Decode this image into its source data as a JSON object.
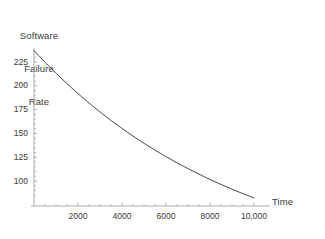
{
  "chart_data": {
    "type": "line",
    "title": "",
    "ylabel_lines": [
      "Software",
      "Failure",
      "Rate"
    ],
    "ylabel": "Software Failure Rate",
    "xlabel": "Time",
    "xlim": [
      0,
      10500
    ],
    "ylim": [
      78,
      245
    ],
    "grid": false,
    "legend": null,
    "x_ticks": [
      {
        "value": 2000,
        "label": "2000"
      },
      {
        "value": 4000,
        "label": "4000"
      },
      {
        "value": 6000,
        "label": "6000"
      },
      {
        "value": 8000,
        "label": "8000"
      },
      {
        "value": 10000,
        "label": "10,000"
      }
    ],
    "x_minor_tick_interval": 500,
    "y_ticks": [
      {
        "value": 225,
        "label": "225"
      },
      {
        "value": 200,
        "label": "200"
      },
      {
        "value": 175,
        "label": "175"
      },
      {
        "value": 150,
        "label": "150"
      },
      {
        "value": 125,
        "label": "125"
      },
      {
        "value": 100,
        "label": "100"
      }
    ],
    "y_minor_tick_interval": 5,
    "series": [
      {
        "name": "Software failure rate",
        "color": "#4a4a4a",
        "x": [
          0,
          500,
          1000,
          1500,
          2000,
          2500,
          3000,
          3500,
          4000,
          4500,
          5000,
          5500,
          6000,
          6500,
          7000,
          7500,
          8000,
          8500,
          9000,
          9500,
          10000
        ],
        "y": [
          237,
          224.8,
          213.2,
          202.2,
          191.8,
          181.9,
          172.5,
          163.6,
          155.2,
          147.2,
          139.6,
          132.4,
          125.6,
          119.1,
          113.0,
          107.2,
          101.6,
          96.4,
          91.4,
          86.7,
          82.2
        ]
      }
    ],
    "axis_color": "#9a9a9a",
    "curve_color": "#4a4a4a"
  }
}
